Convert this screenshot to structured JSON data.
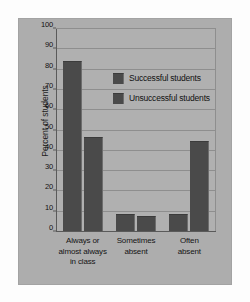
{
  "chart_data": {
    "type": "bar",
    "title": "",
    "xlabel": "",
    "ylabel": "Percent of students",
    "ylim": [
      0,
      100
    ],
    "yticks": [
      0,
      10,
      20,
      30,
      40,
      50,
      60,
      70,
      80,
      90,
      100
    ],
    "grid": true,
    "legend_position": "inside-upper-center",
    "categories": [
      "Always or almost always in class",
      "Sometimes absent",
      "Often absent"
    ],
    "category_lines": [
      [
        "Always or",
        "almost always",
        "in class"
      ],
      [
        "Sometimes",
        "absent"
      ],
      [
        "Often",
        "absent"
      ]
    ],
    "series": [
      {
        "name": "Successful students",
        "values": [
          84,
          9,
          9
        ],
        "color": "#4a4a4a"
      },
      {
        "name": "Unsuccessful students",
        "values": [
          47,
          8,
          45
        ],
        "color": "#4a4a4a"
      }
    ]
  },
  "colors": {
    "panel_background": "#adadad",
    "plot_background": "#b0b0b0",
    "bar": "#4a4a4a",
    "gridline": "#8e8e8e",
    "axis": "#5a5a5a",
    "text": "#111111"
  }
}
